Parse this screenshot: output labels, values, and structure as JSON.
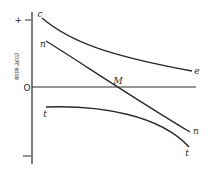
{
  "diagram": {
    "y_axis": {
      "label": "한계효용",
      "plus_label": "+",
      "minus_label": "−",
      "origin_label": "O"
    },
    "curves": [
      {
        "id": "c",
        "start_label": "c",
        "end_label": "e"
      },
      {
        "id": "n",
        "start_label": "n",
        "end_label": "n"
      },
      {
        "id": "t",
        "start_label": "t",
        "end_label": "t"
      }
    ],
    "intersection_label": "M",
    "colors": {
      "line": "#2a2a2a",
      "background": "#ffffff"
    }
  }
}
